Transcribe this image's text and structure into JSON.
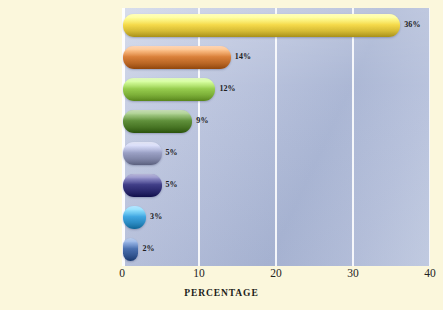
{
  "background_color": "#fbf7dc",
  "plot": {
    "background_color": "#b8c2db",
    "gridline_color": "#ffffff"
  },
  "axis": {
    "title": "PERCENTAGE",
    "tick_labels": [
      "0",
      "10",
      "20",
      "30",
      "40"
    ]
  },
  "chart_data": {
    "type": "bar",
    "orientation": "horizontal",
    "title": "",
    "xlabel": "PERCENTAGE",
    "ylabel": "",
    "xlim": [
      0,
      40
    ],
    "xticks": [
      0,
      10,
      20,
      30,
      40
    ],
    "grid": true,
    "legend": "none",
    "categories": [
      "Love",
      "Companionship",
      "Desire for children",
      "Happiness",
      "Habit or convenience",
      "Money",
      "Dependence",
      "Fear of AIDS"
    ],
    "values": [
      36,
      14,
      12,
      9,
      5,
      5,
      3,
      2
    ],
    "data_labels": [
      "36%",
      "14%",
      "12%",
      "9%",
      "5%",
      "5%",
      "3%",
      "2%"
    ],
    "bar_colors": [
      "#f5d94a",
      "#d9803a",
      "#96cc4e",
      "#5f8f3a",
      "#9aa0c4",
      "#3f3d86",
      "#3fa5e0",
      "#4a6fae"
    ]
  }
}
